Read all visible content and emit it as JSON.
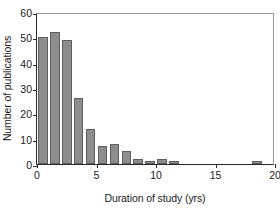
{
  "chart_data": {
    "type": "bar",
    "title": "",
    "xlabel": "Duration of study (yrs)",
    "ylabel": "Number of publications",
    "xlim": [
      0,
      20
    ],
    "ylim": [
      0,
      60
    ],
    "xticks": [
      0,
      5,
      10,
      15,
      20
    ],
    "yticks": [
      0,
      10,
      20,
      30,
      40,
      50,
      60
    ],
    "xtick_labels": [
      "0",
      "5",
      "10",
      "15",
      "20"
    ],
    "ytick_labels": [
      "0",
      "10",
      "20",
      "30",
      "40",
      "50",
      "60"
    ],
    "grid": false,
    "legend": null,
    "bin_width": 1,
    "bar_color": "#8d8d8d",
    "bar_edge_color": "#5f5f5f",
    "axis_color": "#2b2b2b",
    "frame_color": "#9a9a9a",
    "categories": [
      1,
      2,
      3,
      4,
      5,
      6,
      7,
      8,
      9,
      10,
      11,
      12,
      19
    ],
    "values": [
      50,
      52,
      49,
      26,
      14,
      7,
      8,
      5,
      2,
      1,
      2,
      1,
      1
    ],
    "bars": [
      {
        "bin_start": 0,
        "bin_end": 1,
        "value": 50
      },
      {
        "bin_start": 1,
        "bin_end": 2,
        "value": 52
      },
      {
        "bin_start": 2,
        "bin_end": 3,
        "value": 49
      },
      {
        "bin_start": 3,
        "bin_end": 4,
        "value": 26
      },
      {
        "bin_start": 4,
        "bin_end": 5,
        "value": 14
      },
      {
        "bin_start": 5,
        "bin_end": 6,
        "value": 7
      },
      {
        "bin_start": 6,
        "bin_end": 7,
        "value": 8
      },
      {
        "bin_start": 7,
        "bin_end": 8,
        "value": 5
      },
      {
        "bin_start": 8,
        "bin_end": 9,
        "value": 2
      },
      {
        "bin_start": 9,
        "bin_end": 10,
        "value": 1
      },
      {
        "bin_start": 10,
        "bin_end": 11,
        "value": 2
      },
      {
        "bin_start": 11,
        "bin_end": 12,
        "value": 1
      },
      {
        "bin_start": 18,
        "bin_end": 19,
        "value": 1
      }
    ]
  }
}
